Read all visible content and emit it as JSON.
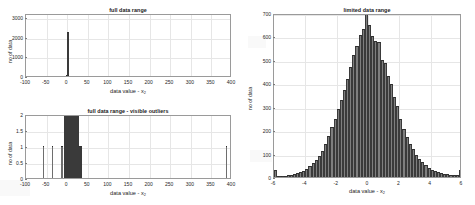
{
  "figure": {
    "background_color": "#ffffff",
    "bar_color": "#7f7f7f",
    "bar_edge_color": "#2e2e2e",
    "grid_color": "#e6e6e6",
    "axis_color": "#9a9a9a"
  },
  "panels": {
    "top_left": {
      "title": "full data range",
      "xlabel_prefix": "data value - x",
      "xlabel_sub": "2",
      "ylabel": "no of data"
    },
    "bottom_left": {
      "title": "full data range - visible outliers",
      "xlabel_prefix": "data value - x",
      "xlabel_sub": "2",
      "ylabel": "no of data"
    },
    "right": {
      "title": "limited data range",
      "xlabel_prefix": "data value - x",
      "xlabel_sub": "2",
      "ylabel": "no of data"
    }
  },
  "chart_data": [
    {
      "id": "full-data-range",
      "type": "bar",
      "title": "full data range",
      "xlabel": "data value - x2",
      "ylabel": "no of data",
      "xlim": [
        -100,
        400
      ],
      "ylim": [
        0,
        3200
      ],
      "xticks": [
        -100,
        -50,
        0,
        50,
        100,
        150,
        200,
        250,
        300,
        350,
        400
      ],
      "xtick_labels": [
        "-100",
        "-50",
        "0",
        "50",
        "100",
        "150",
        "200",
        "250",
        "300",
        "350",
        "400"
      ],
      "yticks": [
        0,
        1000,
        2000,
        3000
      ],
      "ytick_labels": [
        "0",
        "1000",
        "2000",
        "3000"
      ],
      "grid": true,
      "bin_width": 2.5,
      "note": "single tall spike of all in-range data at x=0; outliers invisible at this y-scale",
      "bars": [
        {
          "x": -2.5,
          "height": 60
        },
        {
          "x": 0.0,
          "height": 2260
        },
        {
          "x": 2.5,
          "height": 70
        }
      ]
    },
    {
      "id": "full-data-range-visible-outliers",
      "type": "bar",
      "title": "full data range - visible outliers",
      "xlabel": "data value - x2",
      "ylabel": "no of data",
      "xlim": [
        -100,
        400
      ],
      "ylim": [
        0,
        2
      ],
      "xticks": [
        -100,
        -50,
        0,
        50,
        100,
        150,
        200,
        250,
        300,
        350,
        400
      ],
      "xtick_labels": [
        "-100",
        "-50",
        "0",
        "50",
        "100",
        "150",
        "200",
        "250",
        "300",
        "350",
        "400"
      ],
      "yticks": [
        0,
        0.5,
        1,
        1.5,
        2
      ],
      "ytick_labels": [
        "0",
        "0.5",
        "1",
        "1.5",
        "2"
      ],
      "grid": true,
      "note": "y-axis clipped to 2 so single-count outlier bins become visible",
      "bars": [
        {
          "x": -60,
          "height": 1,
          "thin": true
        },
        {
          "x": -38,
          "height": 1,
          "thin": true
        },
        {
          "x": -16,
          "height": 1,
          "thin": true
        },
        {
          "x": -12,
          "height": 1,
          "thin": true
        },
        {
          "x": -9,
          "height": 2
        },
        {
          "x": -7,
          "height": 2
        },
        {
          "x": -5,
          "height": 2
        },
        {
          "x": -3,
          "height": 2
        },
        {
          "x": -1,
          "height": 2
        },
        {
          "x": 1,
          "height": 2
        },
        {
          "x": 3,
          "height": 2
        },
        {
          "x": 5,
          "height": 2
        },
        {
          "x": 7,
          "height": 2
        },
        {
          "x": 9,
          "height": 2
        },
        {
          "x": 11,
          "height": 2
        },
        {
          "x": 13,
          "height": 2
        },
        {
          "x": 15,
          "height": 2
        },
        {
          "x": 17,
          "height": 2
        },
        {
          "x": 19,
          "height": 1
        },
        {
          "x": 21,
          "height": 1
        },
        {
          "x": 385,
          "height": 1,
          "thin": true
        }
      ]
    },
    {
      "id": "limited-data-range",
      "type": "bar",
      "title": "limited data range",
      "xlabel": "data value - x2",
      "ylabel": "no of data",
      "xlim": [
        -6,
        6
      ],
      "ylim": [
        0,
        700
      ],
      "xticks": [
        -6,
        -4,
        -2,
        0,
        2,
        4,
        6
      ],
      "xtick_labels": [
        "-6",
        "-4",
        "-2",
        "0",
        "2",
        "4",
        "6"
      ],
      "yticks": [
        0,
        100,
        200,
        300,
        400,
        500,
        600,
        700
      ],
      "ytick_labels": [
        "0",
        "100",
        "200",
        "300",
        "400",
        "500",
        "600",
        "700"
      ],
      "grid": true,
      "bin_width": 0.2,
      "distribution": "approximately normal, mean ~0, sd ~1.3, with edge pile-up bins at -6 and +6",
      "bin_centers": [
        -5.9,
        -5.7,
        -5.5,
        -5.3,
        -5.1,
        -4.9,
        -4.7,
        -4.5,
        -4.3,
        -4.1,
        -3.9,
        -3.7,
        -3.5,
        -3.3,
        -3.1,
        -2.9,
        -2.7,
        -2.5,
        -2.3,
        -2.1,
        -1.9,
        -1.7,
        -1.5,
        -1.3,
        -1.1,
        -0.9,
        -0.7,
        -0.5,
        -0.3,
        -0.1,
        0.1,
        0.3,
        0.5,
        0.7,
        0.9,
        1.1,
        1.3,
        1.5,
        1.7,
        1.9,
        2.1,
        2.3,
        2.5,
        2.7,
        2.9,
        3.1,
        3.3,
        3.5,
        3.7,
        3.9,
        4.1,
        4.3,
        4.5,
        4.7,
        4.9,
        5.1,
        5.3,
        5.5,
        5.7,
        5.9
      ],
      "values": [
        28,
        6,
        5,
        6,
        8,
        10,
        12,
        16,
        20,
        26,
        34,
        45,
        58,
        72,
        90,
        112,
        140,
        175,
        212,
        248,
        290,
        330,
        372,
        420,
        470,
        520,
        560,
        608,
        630,
        700,
        650,
        600,
        580,
        575,
        500,
        488,
        430,
        398,
        342,
        305,
        248,
        205,
        172,
        140,
        118,
        95,
        78,
        62,
        50,
        40,
        32,
        26,
        20,
        17,
        14,
        11,
        9,
        8,
        7,
        30
      ]
    }
  ]
}
